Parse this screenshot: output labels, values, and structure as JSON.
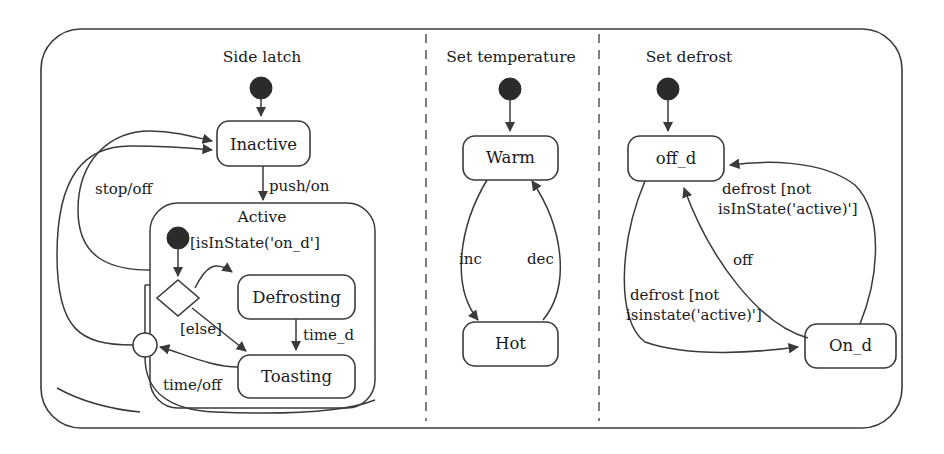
{
  "diagram": {
    "type": "uml-state-machine",
    "title_visible": false,
    "colors": {
      "stroke": "#3a3a3a",
      "fill": "#ffffff",
      "text": "#1a1a1a",
      "initial_node": "#2b2b2b"
    },
    "regions": [
      {
        "id": "side-latch",
        "title": "Side latch",
        "states": [
          {
            "id": "inactive",
            "label": "Inactive"
          },
          {
            "id": "active",
            "label": "Active",
            "composite": true
          },
          {
            "id": "defrosting",
            "label": "Defrosting"
          },
          {
            "id": "toasting",
            "label": "Toasting"
          }
        ],
        "pseudostates": [
          {
            "id": "initial-side-latch",
            "kind": "initial"
          },
          {
            "id": "initial-active",
            "kind": "initial"
          },
          {
            "id": "choice-active",
            "kind": "choice"
          },
          {
            "id": "merge-active",
            "kind": "junction"
          }
        ],
        "transitions": [
          {
            "id": "t-init-inactive",
            "from": "initial-side-latch",
            "to": "inactive",
            "label": ""
          },
          {
            "id": "t-inactive-active",
            "from": "inactive",
            "to": "active",
            "label": "push/on"
          },
          {
            "id": "t-active-inactive-stop",
            "from": "active",
            "to": "inactive",
            "label": "stop/off"
          },
          {
            "id": "t-merge-inactive",
            "from": "merge-active",
            "to": "inactive",
            "label": ""
          },
          {
            "id": "t-choice-defrosting",
            "from": "choice-active",
            "to": "defrosting",
            "label": "[isInState('on_d']"
          },
          {
            "id": "t-choice-toasting",
            "from": "choice-active",
            "to": "toasting",
            "label": "[else]"
          },
          {
            "id": "t-defrosting-toasting",
            "from": "defrosting",
            "to": "toasting",
            "label": "time_d"
          },
          {
            "id": "t-toasting-merge",
            "from": "toasting",
            "to": "merge-active",
            "label": "time/off"
          },
          {
            "id": "t-init-choice",
            "from": "initial-active",
            "to": "choice-active",
            "label": ""
          }
        ]
      },
      {
        "id": "set-temperature",
        "title": "Set temperature",
        "states": [
          {
            "id": "warm",
            "label": "Warm"
          },
          {
            "id": "hot",
            "label": "Hot"
          }
        ],
        "pseudostates": [
          {
            "id": "initial-set-temperature",
            "kind": "initial"
          }
        ],
        "transitions": [
          {
            "id": "t-init-warm",
            "from": "initial-set-temperature",
            "to": "warm",
            "label": ""
          },
          {
            "id": "t-warm-hot",
            "from": "warm",
            "to": "hot",
            "label": "inc"
          },
          {
            "id": "t-hot-warm",
            "from": "hot",
            "to": "warm",
            "label": "dec"
          }
        ]
      },
      {
        "id": "set-defrost",
        "title": "Set defrost",
        "states": [
          {
            "id": "off-d",
            "label": "off_d"
          },
          {
            "id": "on-d",
            "label": "On_d"
          }
        ],
        "pseudostates": [
          {
            "id": "initial-set-defrost",
            "kind": "initial"
          }
        ],
        "transitions": [
          {
            "id": "t-init-offd",
            "from": "initial-set-defrost",
            "to": "off-d",
            "label": ""
          },
          {
            "id": "t-offd-ond",
            "from": "off-d",
            "to": "on-d",
            "label_line1": "defrost [not",
            "label_line2": "isinstate('active)']"
          },
          {
            "id": "t-ond-offd-defrost",
            "from": "on-d",
            "to": "off-d",
            "label_line1": "defrost [not",
            "label_line2": "isInState('active)']"
          },
          {
            "id": "t-ond-offd-off",
            "from": "on-d",
            "to": "off-d",
            "label": "off"
          }
        ]
      }
    ]
  }
}
